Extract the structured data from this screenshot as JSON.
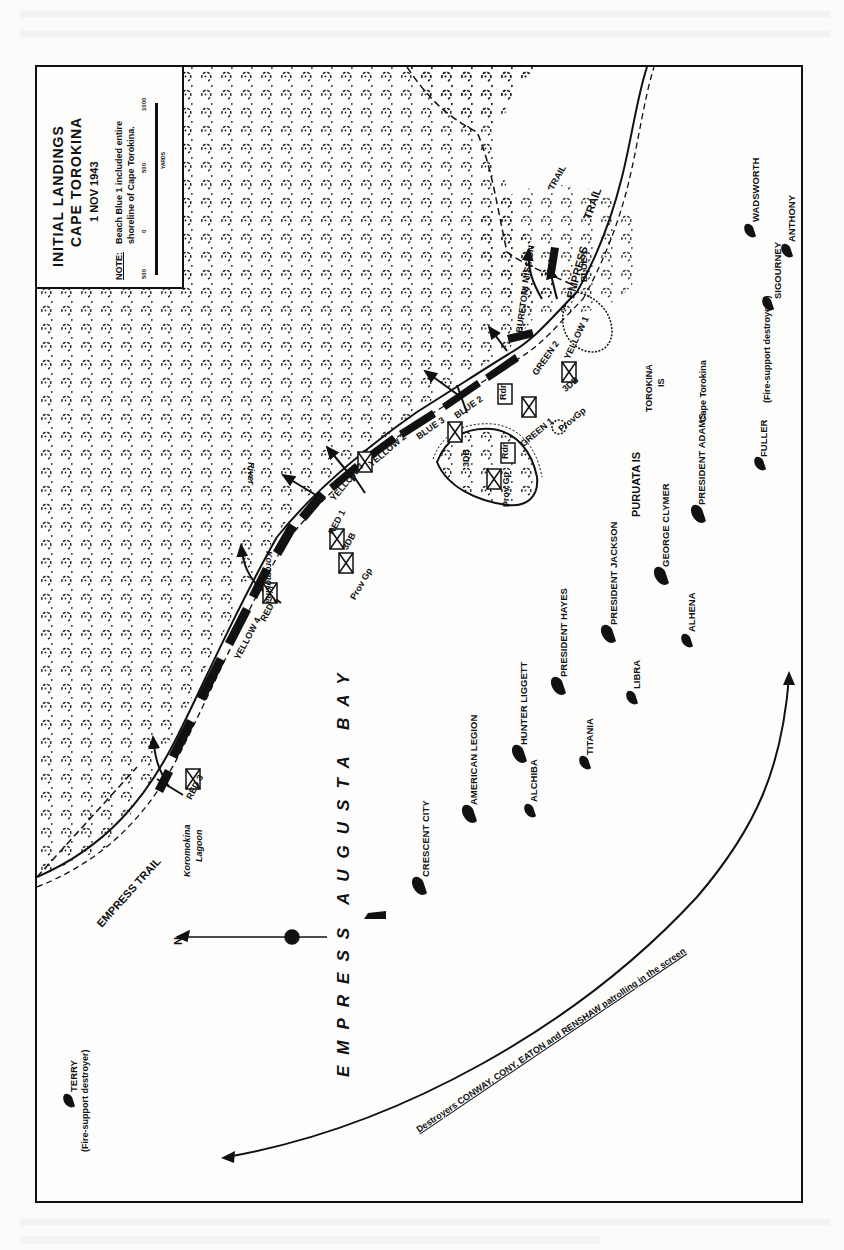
{
  "map": {
    "title_line1": "INITIAL LANDINGS",
    "title_line2": "CAPE TOROKINA",
    "date": "1 NOV 1943",
    "note_label": "NOTE:",
    "note_text_line1": "Beach Blue 1 included entire",
    "note_text_line2": "shoreline of Cape Torokina.",
    "scale": {
      "ticks": [
        "500",
        "0",
        "500",
        "1000"
      ],
      "unit": "YARDS"
    },
    "north_label": "N",
    "water_body": "EMPRESS AUGUSTA BAY",
    "water_body_part1": "EMPRESS",
    "water_body_part2": "AUGUSTA   BAY",
    "features": {
      "river": "Koromokina River",
      "river_word1": "Koromokina",
      "river_word2": "River",
      "lagoon_word1": "Koromokina",
      "lagoon_word2": "Lagoon",
      "empress_trail_left": "EMPRESS TRAIL",
      "empress_trail_right_1": "EMPRESS",
      "empress_trail_right_2": "TRAIL",
      "mission_trail_1": "MISSION",
      "mission_trail_2": "TRAIL",
      "buretoni": "BURETONI",
      "cape": "Cape Torokina",
      "torokina_is_1": "TOROKINA",
      "torokina_is_2": "IS",
      "puruata_is": "PURUATA IS"
    },
    "beaches": [
      {
        "name": "RED 3"
      },
      {
        "name": "RED 2"
      },
      {
        "name": "YELLOW 4"
      },
      {
        "name": "RED 1"
      },
      {
        "name": "YELLOW 3"
      },
      {
        "name": "YELLOW 2"
      },
      {
        "name": "BLUE 3"
      },
      {
        "name": "BLUE 2"
      },
      {
        "name": "GREEN 2"
      },
      {
        "name": "YELLOW 1"
      },
      {
        "name": "GREEN 1"
      },
      {
        "name": "BLUE 1"
      }
    ],
    "units": [
      {
        "label": "1",
        "suffix": "9"
      },
      {
        "label": "2",
        "suffix": "9"
      },
      {
        "label": "3",
        "suffix": "9"
      },
      {
        "label": "3",
        "suffix": "3"
      },
      {
        "label": "2",
        "suffix": "3"
      },
      {
        "label": "Prov Gp",
        "suffix": "3DB"
      },
      {
        "label": "Prov Gp",
        "suffix": "3DB"
      },
      {
        "label": "Rdr",
        "suffix": "2"
      },
      {
        "label": "Rdr",
        "suffix": "3"
      },
      {
        "label": "ProvGp",
        "suffix": "3DB"
      },
      {
        "label": "",
        "suffix": "3"
      }
    ],
    "unit_labels": {
      "prov_gp": "Prov Gp",
      "prov_gp_compact": "ProvGp",
      "db": "3DB",
      "rdr": "Rdr"
    },
    "ships": [
      {
        "name": "CRESCENT CITY"
      },
      {
        "name": "AMERICAN LEGION"
      },
      {
        "name": "ALCHIBA"
      },
      {
        "name": "HUNTER LIGGETT"
      },
      {
        "name": "TITANIA"
      },
      {
        "name": "PRESIDENT HAYES"
      },
      {
        "name": "LIBRA"
      },
      {
        "name": "PRESIDENT JACKSON"
      },
      {
        "name": "ALHENA"
      },
      {
        "name": "GEORGE CLYMER"
      },
      {
        "name": "PRESIDENT ADAMS"
      },
      {
        "name": "FULLER"
      },
      {
        "name": "SIGOURNEY"
      },
      {
        "name": "ANTHONY"
      },
      {
        "name": "WADSWORTH"
      },
      {
        "name": "TERRY"
      }
    ],
    "fire_support_note": "(Fire-support destroyers)",
    "terry_note": "(Fire-support destroyer)",
    "screen_note": "Destroyers CONWAY, CONY, EATON and RENSHAW patrolling in the screen"
  }
}
